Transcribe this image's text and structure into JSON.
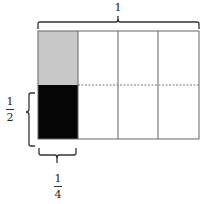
{
  "diagram": {
    "top_label": "1",
    "left_label": {
      "numerator": "1",
      "denominator": "2"
    },
    "bottom_label": {
      "numerator": "1",
      "denominator": "4"
    },
    "grid": {
      "columns": 4,
      "rows": 2
    },
    "cells": [
      {
        "row": 0,
        "col": 0,
        "fill": "#c8c8c8"
      },
      {
        "row": 1,
        "col": 0,
        "fill": "#050505"
      }
    ],
    "colors": {
      "line": "#555555",
      "shaded_light": "#c8c8c8",
      "shaded_dark": "#050505"
    }
  }
}
